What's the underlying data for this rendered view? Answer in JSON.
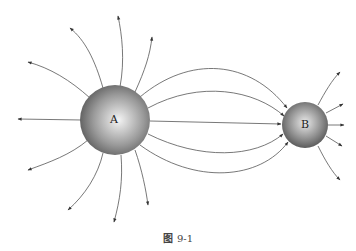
{
  "figure": {
    "caption_prefix": "图",
    "caption_number": "9-1"
  },
  "charges": [
    {
      "label": "A",
      "cx": 115,
      "cy": 120,
      "r": 35
    },
    {
      "label": "B",
      "cx": 305,
      "cy": 125,
      "r": 23
    }
  ],
  "colors": {
    "line": "#444444",
    "sphere_light": "#f0f0f0",
    "sphere_dark": "#555555"
  }
}
